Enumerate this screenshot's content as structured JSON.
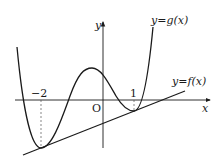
{
  "diagram": {
    "axis_x_label": "x",
    "axis_y_label": "y",
    "origin_label": "O",
    "tick_labels": [
      {
        "value": -2,
        "text": "−2"
      },
      {
        "value": 1,
        "text": "1"
      }
    ],
    "curves": [
      {
        "name": "g",
        "label": "y=g(x)",
        "type": "quartic",
        "description": "W-shaped curve with minimum at x=-2, local maximum near x=-0.4, local minimum at x=1"
      },
      {
        "name": "f",
        "label": "y=f(x)",
        "type": "line",
        "description": "line tangent to g at x=-2 and x=1"
      }
    ],
    "tangent_points_x": [
      -2,
      1
    ],
    "colors": {
      "stroke": "#1a1a1a",
      "dashed": "#555555"
    }
  }
}
